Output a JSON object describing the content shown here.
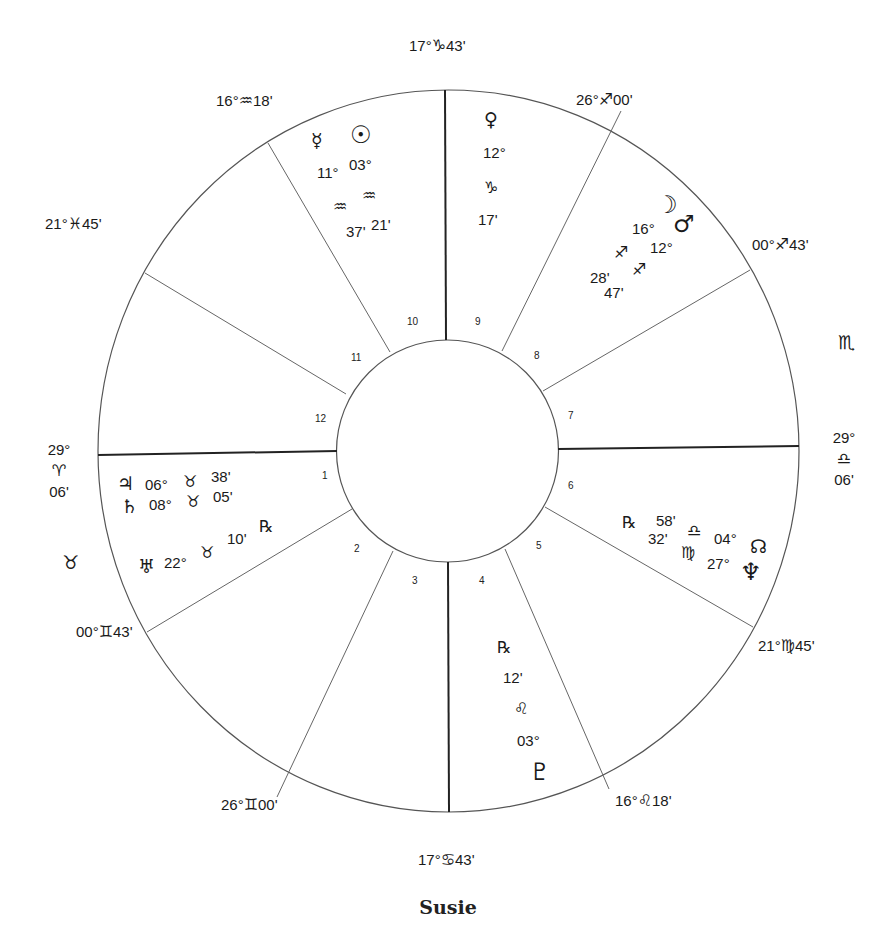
{
  "chart_title": "Susie",
  "cusps": {
    "mc": {
      "deg": "17°",
      "sign": "♑",
      "min": "43'"
    },
    "c11": {
      "deg": "16°",
      "sign": "♒",
      "min": "18'"
    },
    "c12": {
      "deg": "21°",
      "sign": "♓",
      "min": "45'"
    },
    "asc": {
      "deg": "29°",
      "sign": "♈",
      "min": "06'"
    },
    "c2": {
      "deg": "00°",
      "sign": "♊",
      "min": "43'"
    },
    "c3": {
      "deg": "26°",
      "sign": "♊",
      "min": "00'"
    },
    "ic": {
      "deg": "17°",
      "sign": "♋",
      "min": "43'"
    },
    "c5": {
      "deg": "16°",
      "sign": "♌",
      "min": "18'"
    },
    "c6": {
      "deg": "21°",
      "sign": "♍",
      "min": "45'"
    },
    "dsc": {
      "deg": "29°",
      "sign": "♎",
      "min": "06'"
    },
    "c8": {
      "deg": "00°",
      "sign": "♐",
      "min": "43'"
    },
    "c9": {
      "deg": "26°",
      "sign": "♐",
      "min": "00'"
    }
  },
  "intercepted": {
    "house1": "♉",
    "house7": "♏"
  },
  "houses": [
    "1",
    "2",
    "3",
    "4",
    "5",
    "6",
    "7",
    "8",
    "9",
    "10",
    "11",
    "12"
  ],
  "planets": {
    "mercury": {
      "glyph": "☿",
      "deg": "11°",
      "sign": "♒",
      "min": "37'"
    },
    "sun": {
      "glyph": "☉",
      "deg": "03°",
      "sign": "♒",
      "min": "21'"
    },
    "venus": {
      "glyph": "♀",
      "deg": "12°",
      "sign": "♑",
      "min": "17'"
    },
    "moon": {
      "glyph": "☽",
      "deg": "16°",
      "sign": "♐",
      "min": "28'"
    },
    "mars": {
      "glyph": "♂",
      "deg": "12°",
      "sign": "♐",
      "min": "47'"
    },
    "jupiter": {
      "glyph": "♃",
      "deg": "06°",
      "sign": "♉",
      "min": "38'"
    },
    "saturn": {
      "glyph": "♄",
      "deg": "08°",
      "sign": "♉",
      "min": "05'"
    },
    "uranus": {
      "glyph": "♅",
      "deg": "22°",
      "sign": "♉",
      "min": "10'",
      "retro": "℞"
    },
    "pluto": {
      "glyph": "♇",
      "deg": "03°",
      "sign": "♌",
      "min": "12'",
      "retro": "℞"
    },
    "node": {
      "glyph": "☊",
      "deg": "04°",
      "sign": "♎",
      "min": "58'",
      "retro": "℞"
    },
    "neptune": {
      "glyph": "♆",
      "deg": "27°",
      "sign": "♍",
      "min": "32'"
    }
  },
  "colors": {
    "line": "#333333",
    "ink": "#1a1a1a",
    "background": "#ffffff"
  }
}
